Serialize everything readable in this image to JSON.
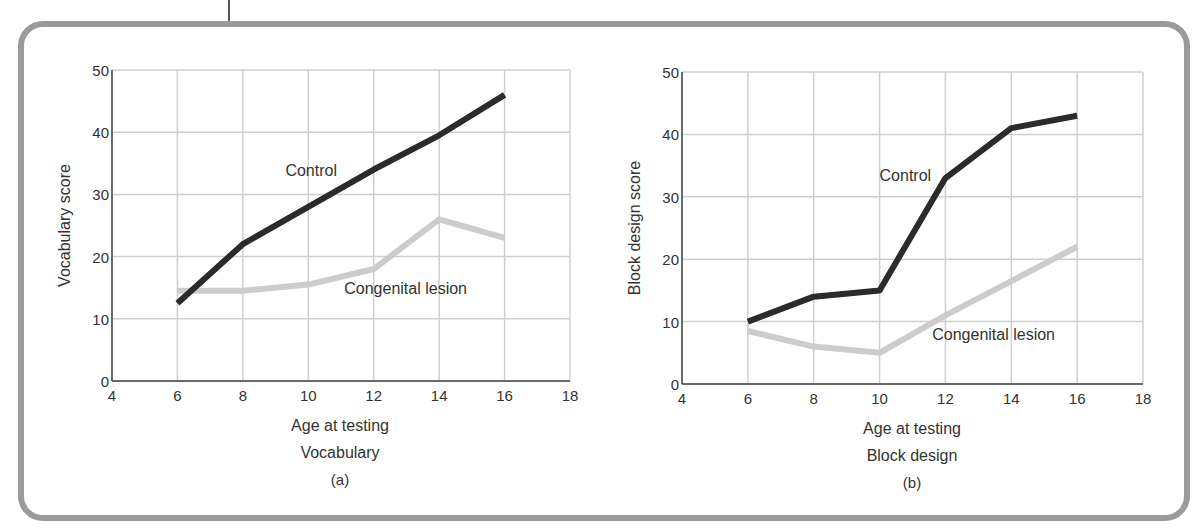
{
  "figure": {
    "frame_color": "#9a9a9a",
    "grid_color": "#cfcfcf",
    "axis_color": "#444444",
    "control_color": "#2b2b2b",
    "lesion_color": "#cccccc"
  },
  "chart_data": [
    {
      "type": "line",
      "panel_label": "(a)",
      "title": "Vocabulary",
      "xlabel": "Age at testing",
      "ylabel": "Vocabulary score",
      "xlim": [
        4,
        18
      ],
      "ylim": [
        0,
        50
      ],
      "xticks": [
        4,
        6,
        8,
        10,
        12,
        14,
        16,
        18
      ],
      "yticks": [
        0,
        10,
        20,
        30,
        40,
        50
      ],
      "grid": true,
      "legend": "inline labels",
      "x": [
        6,
        8,
        10,
        12,
        14,
        16
      ],
      "series": [
        {
          "name": "Control",
          "values": [
            12.5,
            22,
            28,
            34,
            39.5,
            46
          ]
        },
        {
          "name": "Congenital lesion",
          "values": [
            14.5,
            14.5,
            15.5,
            18,
            26,
            23
          ]
        }
      ],
      "annotations": [
        {
          "text": "Control",
          "x": 9.3,
          "y": 33
        },
        {
          "text": "Congenital lesion",
          "x": 11.1,
          "y": 14
        }
      ]
    },
    {
      "type": "line",
      "panel_label": "(b)",
      "title": "Block design",
      "xlabel": "Age at testing",
      "ylabel": "Block design score",
      "xlim": [
        4,
        18
      ],
      "ylim": [
        0,
        50
      ],
      "xticks": [
        4,
        6,
        8,
        10,
        12,
        14,
        16,
        18
      ],
      "yticks": [
        0,
        10,
        20,
        30,
        40,
        50
      ],
      "grid": true,
      "legend": "inline labels",
      "x": [
        6,
        8,
        10,
        12,
        14,
        16
      ],
      "series": [
        {
          "name": "Control",
          "values": [
            10,
            14,
            15,
            33,
            41,
            43
          ]
        },
        {
          "name": "Congenital lesion",
          "values": [
            8.5,
            6,
            5,
            11,
            16.5,
            22
          ]
        }
      ],
      "annotations": [
        {
          "text": "Control",
          "x": 10,
          "y": 32.5
        },
        {
          "text": "Congenital lesion",
          "x": 11.6,
          "y": 7
        }
      ]
    }
  ]
}
